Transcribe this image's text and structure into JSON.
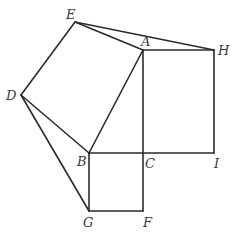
{
  "diagram": {
    "points": {
      "E": {
        "x": 75,
        "y": 22
      },
      "D": {
        "x": 21,
        "y": 95
      },
      "A": {
        "x": 143,
        "y": 50
      },
      "H": {
        "x": 214,
        "y": 50
      },
      "B": {
        "x": 89,
        "y": 153
      },
      "C": {
        "x": 143,
        "y": 153
      },
      "I": {
        "x": 214,
        "y": 153
      },
      "G": {
        "x": 89,
        "y": 211
      },
      "F": {
        "x": 143,
        "y": 211
      }
    },
    "labels": [
      {
        "id": "E",
        "text": "E",
        "x": 66,
        "y": 19
      },
      {
        "id": "D",
        "text": "D",
        "x": 6,
        "y": 100
      },
      {
        "id": "A",
        "text": "A",
        "x": 141,
        "y": 46
      },
      {
        "id": "H",
        "text": "H",
        "x": 218,
        "y": 55
      },
      {
        "id": "B",
        "text": "B",
        "x": 77,
        "y": 166
      },
      {
        "id": "C",
        "text": "C",
        "x": 145,
        "y": 168
      },
      {
        "id": "I",
        "text": "I",
        "x": 214,
        "y": 168
      },
      {
        "id": "G",
        "text": "G",
        "x": 83,
        "y": 227
      },
      {
        "id": "F",
        "text": "F",
        "x": 143,
        "y": 227
      }
    ],
    "segments": [
      [
        "D",
        "E"
      ],
      [
        "E",
        "A"
      ],
      [
        "A",
        "B"
      ],
      [
        "B",
        "D"
      ],
      [
        "E",
        "H"
      ],
      [
        "A",
        "H"
      ],
      [
        "H",
        "I"
      ],
      [
        "B",
        "I"
      ],
      [
        "A",
        "F"
      ],
      [
        "B",
        "G"
      ],
      [
        "G",
        "F"
      ],
      [
        "D",
        "G"
      ]
    ]
  }
}
